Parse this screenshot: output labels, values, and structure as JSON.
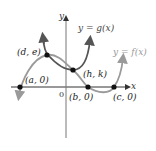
{
  "diagram": {
    "axes": {
      "x_label": "x",
      "y_label": "y",
      "origin_label": "0",
      "color": "#333333"
    },
    "curves": [
      {
        "name": "g",
        "label": "y = g(x)",
        "color": "#555555"
      },
      {
        "name": "f",
        "label": "y = f(x)",
        "color": "#9a9a9a"
      }
    ],
    "points": [
      {
        "label": "(a, 0)"
      },
      {
        "label": "(d, e)"
      },
      {
        "label": "(h, k)"
      },
      {
        "label": "(b, 0)"
      },
      {
        "label": "(c, 0)"
      }
    ]
  }
}
